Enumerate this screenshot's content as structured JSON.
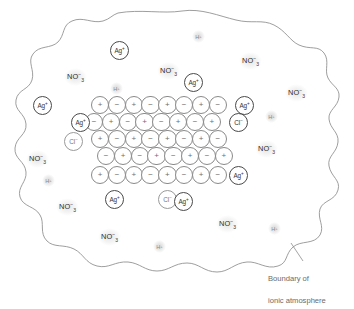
{
  "figure": {
    "caption_line1": "Boundary of",
    "caption_line2": "ionic atmosphere",
    "boundary_color": "#8d8d8d",
    "lattice_circle_color": "#8a8a8a",
    "ion_circle_color": "#4a4a4a",
    "label_color": "#2e2e2e",
    "faint_color": "#a5a5a5"
  },
  "lattice": {
    "description": "Alternating cation/anion sites of an ionic crystal",
    "plus": "+",
    "minus": "−",
    "rows": [
      {
        "left": 91,
        "top": 96,
        "signs": [
          "+",
          "−",
          "+",
          "−",
          "+",
          "−",
          "+",
          "−"
        ]
      },
      {
        "left": 85,
        "top": 113,
        "signs": [
          "−",
          "+",
          "−",
          "+",
          "−",
          "+",
          "−",
          "+"
        ]
      },
      {
        "left": 91,
        "top": 130,
        "signs": [
          "+",
          "−",
          "+",
          "−",
          "+",
          "−",
          "+",
          "−"
        ]
      },
      {
        "left": 97,
        "top": 147,
        "signs": [
          "−",
          "+",
          "−",
          "+",
          "−",
          "+",
          "−",
          "+"
        ]
      },
      {
        "left": 91,
        "top": 166,
        "signs": [
          "+",
          "−",
          "+",
          "−",
          "+",
          "−",
          "+",
          "−"
        ]
      }
    ]
  },
  "ions": [
    {
      "name": "ag-plus-top",
      "label": "Ag",
      "charge": "+",
      "left": 110,
      "top": 41,
      "pale": false
    },
    {
      "name": "ag-plus-upper-mid",
      "label": "Ag",
      "charge": "+",
      "left": 184,
      "top": 73,
      "pale": false
    },
    {
      "name": "ag-plus-left",
      "label": "Ag",
      "charge": "+",
      "left": 33,
      "top": 96,
      "pale": false
    },
    {
      "name": "ag-plus-row1-end",
      "label": "Ag",
      "charge": "+",
      "left": 235,
      "top": 96,
      "pale": false
    },
    {
      "name": "ag-plus-row2-start",
      "label": "Ag",
      "charge": "+",
      "left": 71,
      "top": 113,
      "pale": false
    },
    {
      "name": "cl-minus-row2-end",
      "label": "Cl",
      "charge": "−",
      "left": 229,
      "top": 113,
      "pale": false
    },
    {
      "name": "cl-minus-row3-start",
      "label": "Cl",
      "charge": "−",
      "left": 64,
      "top": 132,
      "pale": true
    },
    {
      "name": "ag-plus-row5-end",
      "label": "Ag",
      "charge": "+",
      "left": 229,
      "top": 166,
      "pale": false
    },
    {
      "name": "ag-plus-bottom-left",
      "label": "Ag",
      "charge": "+",
      "left": 105,
      "top": 190,
      "pale": false
    },
    {
      "name": "cl-minus-bottom",
      "label": "Cl",
      "charge": "−",
      "left": 158,
      "top": 190,
      "pale": true
    },
    {
      "name": "ag-plus-bottom-mid",
      "label": "Ag",
      "charge": "+",
      "left": 174,
      "top": 192,
      "pale": false
    }
  ],
  "nitrate_ions": [
    {
      "name": "no3-upper-left",
      "left": 64,
      "top": 68
    },
    {
      "name": "no3-top-mid",
      "left": 157,
      "top": 62
    },
    {
      "name": "no3-top-right",
      "left": 239,
      "top": 52
    },
    {
      "name": "no3-right-upper",
      "left": 285,
      "top": 84
    },
    {
      "name": "no3-right-mid",
      "left": 255,
      "top": 140
    },
    {
      "name": "no3-left-mid",
      "left": 26,
      "top": 150
    },
    {
      "name": "no3-left-lower",
      "left": 56,
      "top": 198
    },
    {
      "name": "no3-bottom-mid",
      "left": 98,
      "top": 228
    },
    {
      "name": "no3-bottom-right",
      "left": 216,
      "top": 215
    }
  ],
  "protons": [
    {
      "name": "h-plus-top",
      "left": 192,
      "top": 30
    },
    {
      "name": "h-plus-upper-left",
      "left": 110,
      "top": 82
    },
    {
      "name": "h-plus-right",
      "left": 265,
      "top": 110
    },
    {
      "name": "h-plus-left",
      "left": 42,
      "top": 174
    },
    {
      "name": "h-plus-bottom",
      "left": 153,
      "top": 240
    },
    {
      "name": "h-plus-bottom-right",
      "left": 268,
      "top": 222
    }
  ],
  "labels": {
    "nitrate_formula": "NO",
    "nitrate_subscript": "3",
    "nitrate_charge": "−",
    "proton_symbol": "H",
    "proton_charge": "+"
  }
}
